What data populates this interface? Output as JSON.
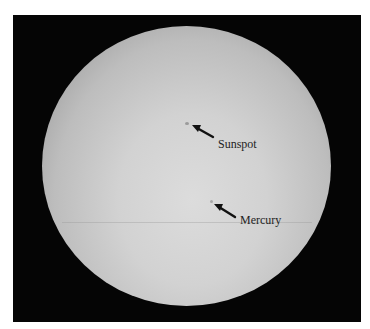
{
  "image": {
    "subject": "Solar disc showing a sunspot and the transit of Mercury",
    "background_color": "#050505",
    "disc_center_color": "#dcdcdc",
    "disc_limb_color": "#6f6f6f"
  },
  "annotations": [
    {
      "label": "Sunspot",
      "feature": "sunspot",
      "dot": {
        "x": 187,
        "y": 124
      }
    },
    {
      "label": "Mercury",
      "feature": "mercury",
      "dot": {
        "x": 211,
        "y": 201
      }
    }
  ]
}
